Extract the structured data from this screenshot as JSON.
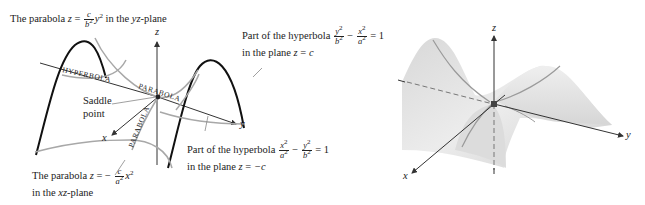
{
  "left_figure": {
    "top_label": {
      "prefix": "The parabola ",
      "var": "z",
      "eq": " = ",
      "frac_num": "c",
      "frac_den": "b",
      "frac_den_exp": "2",
      "tail_var": "y",
      "tail_exp": "2",
      "suffix": " in the ",
      "plane": "yz",
      "plane_suffix": "-plane"
    },
    "upper_right_label": {
      "line1_prefix": "Part of the hyperbola ",
      "frac1_num": "y",
      "frac1_num_exp": "2",
      "frac1_den": "b",
      "frac1_den_exp": "2",
      "minus": " − ",
      "frac2_num": "x",
      "frac2_num_exp": "2",
      "frac2_den": "a",
      "frac2_den_exp": "2",
      "equals": " = 1",
      "line2_prefix": "in the plane ",
      "line2_var": "z",
      "line2_eq": " = ",
      "line2_val": "c"
    },
    "lower_right_label": {
      "line1_prefix": "Part of the hyperbola ",
      "frac1_num": "x",
      "frac1_num_exp": "2",
      "frac1_den": "a",
      "frac1_den_exp": "2",
      "minus": " − ",
      "frac2_num": "y",
      "frac2_num_exp": "2",
      "frac2_den": "b",
      "frac2_den_exp": "2",
      "equals": " = 1",
      "line2_prefix": "in the plane ",
      "line2_var": "z",
      "line2_eq": " = ",
      "line2_val": "−c"
    },
    "bottom_label": {
      "prefix": "The parabola ",
      "var": "z",
      "eq": " = − ",
      "frac_num": "c",
      "frac_den": "a",
      "frac_den_exp": "2",
      "tail_var": "x",
      "tail_exp": "2",
      "line2_prefix": "in the ",
      "plane": "xz",
      "plane_suffix": "-plane"
    },
    "saddle_label": {
      "line1": "Saddle",
      "line2": "point"
    },
    "curve_labels": {
      "hyperbola": "HYPERBOLA",
      "parabola_upper": "PARABOLA",
      "parabola_lower": "PARABOLA"
    },
    "axes": {
      "x": "x",
      "y": "y",
      "z": "z"
    },
    "colors": {
      "curve_dark": "#111111",
      "curve_gray": "#a8a8a8",
      "axis": "#333333"
    }
  },
  "right_figure": {
    "axes": {
      "x": "x",
      "y": "y",
      "z": "z"
    },
    "colors": {
      "surface": "#e4e4e4",
      "surface_shadow": "#d0d0d0",
      "curve": "#9a9a9a",
      "axis": "#333333",
      "dashed": "#777777",
      "saddle_point": "#444444"
    }
  }
}
